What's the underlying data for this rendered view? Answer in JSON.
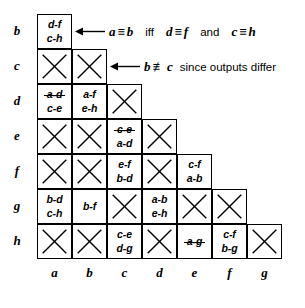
{
  "chart_data": {
    "type": "table",
    "row_labels": [
      "b",
      "c",
      "d",
      "e",
      "f",
      "g",
      "h"
    ],
    "col_labels": [
      "a",
      "b",
      "c",
      "d",
      "e",
      "f",
      "g"
    ],
    "cells": [
      [
        {
          "kind": "pairs",
          "lines": [
            {
              "text": "d-f",
              "struck": false
            },
            {
              "text": "c-h",
              "struck": false
            }
          ]
        }
      ],
      [
        {
          "kind": "x"
        },
        {
          "kind": "x"
        }
      ],
      [
        {
          "kind": "pairs",
          "lines": [
            {
              "text": "a-d",
              "struck": true
            },
            {
              "text": "c-e",
              "struck": false
            }
          ]
        },
        {
          "kind": "pairs",
          "lines": [
            {
              "text": "a-f",
              "struck": false
            },
            {
              "text": "e-h",
              "struck": false
            }
          ]
        },
        {
          "kind": "x"
        }
      ],
      [
        {
          "kind": "x"
        },
        {
          "kind": "x"
        },
        {
          "kind": "pairs",
          "lines": [
            {
              "text": "c-e",
              "struck": true
            },
            {
              "text": "a-d",
              "struck": false
            }
          ]
        },
        {
          "kind": "x"
        }
      ],
      [
        {
          "kind": "x"
        },
        {
          "kind": "x"
        },
        {
          "kind": "pairs",
          "lines": [
            {
              "text": "e-f",
              "struck": false
            },
            {
              "text": "b-d",
              "struck": false
            }
          ]
        },
        {
          "kind": "x"
        },
        {
          "kind": "pairs",
          "lines": [
            {
              "text": "c-f",
              "struck": false
            },
            {
              "text": "a-b",
              "struck": false
            }
          ]
        }
      ],
      [
        {
          "kind": "pairs",
          "lines": [
            {
              "text": "b-d",
              "struck": false
            },
            {
              "text": "c-h",
              "struck": false
            }
          ]
        },
        {
          "kind": "pairs",
          "lines": [
            {
              "text": "b-f",
              "struck": false
            }
          ]
        },
        {
          "kind": "x"
        },
        {
          "kind": "pairs",
          "lines": [
            {
              "text": "a-b",
              "struck": false
            },
            {
              "text": "e-h",
              "struck": false
            }
          ]
        },
        {
          "kind": "x"
        },
        {
          "kind": "x"
        }
      ],
      [
        {
          "kind": "x"
        },
        {
          "kind": "x"
        },
        {
          "kind": "pairs",
          "lines": [
            {
              "text": "c-e",
              "struck": false
            },
            {
              "text": "d-g",
              "struck": false
            }
          ]
        },
        {
          "kind": "x"
        },
        {
          "kind": "pairs",
          "lines": [
            {
              "text": "a-g",
              "struck": true
            }
          ]
        },
        {
          "kind": "pairs",
          "lines": [
            {
              "text": "c-f",
              "struck": false
            },
            {
              "text": "b-g",
              "struck": false
            }
          ]
        },
        {
          "kind": "x"
        }
      ]
    ]
  },
  "annotations": [
    {
      "id": "annotation-equivalence",
      "target_cell": "row-b-col-a",
      "parts": [
        {
          "type": "italic",
          "text": "a"
        },
        {
          "type": "op",
          "text": "≡"
        },
        {
          "type": "italic",
          "text": "b"
        },
        {
          "type": "gap",
          "text": "md"
        },
        {
          "type": "word",
          "text": "iff"
        },
        {
          "type": "gap",
          "text": "md"
        },
        {
          "type": "italic",
          "text": "d"
        },
        {
          "type": "op",
          "text": "≡"
        },
        {
          "type": "italic",
          "text": "f"
        },
        {
          "type": "gap",
          "text": "md"
        },
        {
          "type": "word",
          "text": "and"
        },
        {
          "type": "gap",
          "text": "md"
        },
        {
          "type": "italic",
          "text": "c"
        },
        {
          "type": "op",
          "text": "≡"
        },
        {
          "type": "italic",
          "text": "h"
        }
      ],
      "plain_text": "a ≡ b  iff  d ≡ f  and  c ≡ h"
    },
    {
      "id": "annotation-nonequivalence",
      "target_cell": "row-c-col-b",
      "parts": [
        {
          "type": "italic",
          "text": "b"
        },
        {
          "type": "op",
          "text": "≢"
        },
        {
          "type": "italic",
          "text": "c"
        },
        {
          "type": "gap",
          "text": "sm"
        },
        {
          "type": "word",
          "text": "since outputs differ"
        }
      ],
      "plain_text": "b ≢ c since outputs differ"
    }
  ],
  "colors": {
    "ink": "#000000",
    "background": "#ffffff"
  }
}
